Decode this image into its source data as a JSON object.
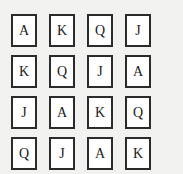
{
  "canvas": {
    "width": 183,
    "height": 174,
    "background_color": "#f2f2f0"
  },
  "grid": {
    "rows": 4,
    "columns": 4,
    "card_border_color": "#2b2b2b",
    "card_fill_color": "#ffffff",
    "rank_text_color": "#1a1a1a",
    "cards": [
      {
        "rank": "A",
        "row": 1,
        "column": 1
      },
      {
        "rank": "K",
        "row": 1,
        "column": 2
      },
      {
        "rank": "Q",
        "row": 1,
        "column": 3
      },
      {
        "rank": "J",
        "row": 1,
        "column": 4
      },
      {
        "rank": "K",
        "row": 2,
        "column": 1
      },
      {
        "rank": "Q",
        "row": 2,
        "column": 2
      },
      {
        "rank": "J",
        "row": 2,
        "column": 3
      },
      {
        "rank": "A",
        "row": 2,
        "column": 4
      },
      {
        "rank": "J",
        "row": 3,
        "column": 1
      },
      {
        "rank": "A",
        "row": 3,
        "column": 2
      },
      {
        "rank": "K",
        "row": 3,
        "column": 3
      },
      {
        "rank": "Q",
        "row": 3,
        "column": 4
      },
      {
        "rank": "Q",
        "row": 4,
        "column": 1
      },
      {
        "rank": "J",
        "row": 4,
        "column": 2
      },
      {
        "rank": "A",
        "row": 4,
        "column": 3
      },
      {
        "rank": "K",
        "row": 4,
        "column": 4
      }
    ]
  }
}
